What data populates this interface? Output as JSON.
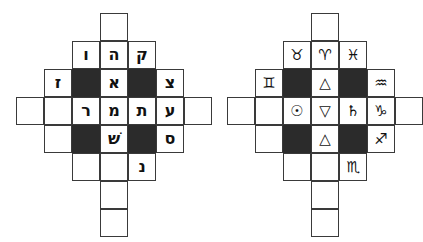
{
  "meta": {
    "background_color": "#ffffff",
    "line_color": "#3a3a3a",
    "fill_color": "#2b2b2b",
    "glyph_color": "#111111"
  },
  "figures": [
    {
      "id": "figure-left",
      "name": "hebrew-letter-cross",
      "script": "hebrew",
      "cells": [
        {
          "name": "top-outer",
          "col": 2,
          "row": 0,
          "fill": "white",
          "glyph": ""
        },
        {
          "name": "row1-col1",
          "col": 1,
          "row": 1,
          "fill": "white",
          "glyph": "ו"
        },
        {
          "name": "row1-col2",
          "col": 2,
          "row": 1,
          "fill": "white",
          "glyph": "ה"
        },
        {
          "name": "row1-col3",
          "col": 3,
          "row": 1,
          "fill": "white",
          "glyph": "ק"
        },
        {
          "name": "row2-col0",
          "col": 0,
          "row": 2,
          "fill": "white",
          "glyph": "ז"
        },
        {
          "name": "row2-col1",
          "col": 1,
          "row": 2,
          "fill": "black",
          "glyph": ""
        },
        {
          "name": "row2-col2",
          "col": 2,
          "row": 2,
          "fill": "white",
          "glyph": "א"
        },
        {
          "name": "row2-col3",
          "col": 3,
          "row": 2,
          "fill": "black",
          "glyph": ""
        },
        {
          "name": "row2-col4",
          "col": 4,
          "row": 2,
          "fill": "white",
          "glyph": "צ"
        },
        {
          "name": "row3-colm1",
          "col": -1,
          "row": 3,
          "fill": "white",
          "glyph": ""
        },
        {
          "name": "row3-col0",
          "col": 0,
          "row": 3,
          "fill": "white",
          "glyph": ""
        },
        {
          "name": "row3-col1",
          "col": 1,
          "row": 3,
          "fill": "white",
          "glyph": "ר"
        },
        {
          "name": "row3-col2",
          "col": 2,
          "row": 3,
          "fill": "white",
          "glyph": "מ"
        },
        {
          "name": "row3-col3",
          "col": 3,
          "row": 3,
          "fill": "white",
          "glyph": "ת"
        },
        {
          "name": "row3-col4",
          "col": 4,
          "row": 3,
          "fill": "white",
          "glyph": "ע"
        },
        {
          "name": "row3-col5",
          "col": 5,
          "row": 3,
          "fill": "white",
          "glyph": ""
        },
        {
          "name": "row4-col0",
          "col": 0,
          "row": 4,
          "fill": "white",
          "glyph": ""
        },
        {
          "name": "row4-col1",
          "col": 1,
          "row": 4,
          "fill": "black",
          "glyph": ""
        },
        {
          "name": "row4-col2",
          "col": 2,
          "row": 4,
          "fill": "white",
          "glyph": "שׁ"
        },
        {
          "name": "row4-col3",
          "col": 3,
          "row": 4,
          "fill": "black",
          "glyph": ""
        },
        {
          "name": "row4-col4",
          "col": 4,
          "row": 4,
          "fill": "white",
          "glyph": "ס"
        },
        {
          "name": "row5-col1",
          "col": 1,
          "row": 5,
          "fill": "white",
          "glyph": ""
        },
        {
          "name": "row5-col2",
          "col": 2,
          "row": 5,
          "fill": "white",
          "glyph": ""
        },
        {
          "name": "row5-col3",
          "col": 3,
          "row": 5,
          "fill": "white",
          "glyph": "נ"
        },
        {
          "name": "row6-col2",
          "col": 2,
          "row": 6,
          "fill": "white",
          "glyph": ""
        },
        {
          "name": "row7-col2",
          "col": 2,
          "row": 7,
          "fill": "white",
          "glyph": ""
        }
      ]
    },
    {
      "id": "figure-right",
      "name": "astrological-symbol-cross",
      "script": "astro",
      "cells": [
        {
          "name": "top-outer",
          "col": 2,
          "row": 0,
          "fill": "white",
          "glyph": "",
          "label": ""
        },
        {
          "name": "row1-col1",
          "col": 1,
          "row": 1,
          "fill": "white",
          "glyph": "♉",
          "label": "taurus"
        },
        {
          "name": "row1-col2",
          "col": 2,
          "row": 1,
          "fill": "white",
          "glyph": "♈",
          "label": "aries"
        },
        {
          "name": "row1-col3",
          "col": 3,
          "row": 1,
          "fill": "white",
          "glyph": "♓",
          "label": "pisces"
        },
        {
          "name": "row2-col0",
          "col": 0,
          "row": 2,
          "fill": "white",
          "glyph": "♊",
          "label": "gemini"
        },
        {
          "name": "row2-col1",
          "col": 1,
          "row": 2,
          "fill": "black",
          "glyph": "",
          "label": ""
        },
        {
          "name": "row2-col2",
          "col": 2,
          "row": 2,
          "fill": "white",
          "glyph": "△",
          "label": "fire-triangle"
        },
        {
          "name": "row2-col3",
          "col": 3,
          "row": 2,
          "fill": "black",
          "glyph": "",
          "label": ""
        },
        {
          "name": "row2-col4",
          "col": 4,
          "row": 2,
          "fill": "white",
          "glyph": "♒",
          "label": "aquarius"
        },
        {
          "name": "row3-colm1",
          "col": -1,
          "row": 3,
          "fill": "white",
          "glyph": "",
          "label": ""
        },
        {
          "name": "row3-col0",
          "col": 0,
          "row": 3,
          "fill": "white",
          "glyph": "",
          "label": ""
        },
        {
          "name": "row3-col1",
          "col": 1,
          "row": 3,
          "fill": "white",
          "glyph": "☉",
          "label": "sun"
        },
        {
          "name": "row3-col2",
          "col": 2,
          "row": 3,
          "fill": "white",
          "glyph": "▽",
          "label": "water-triangle"
        },
        {
          "name": "row3-col3",
          "col": 3,
          "row": 3,
          "fill": "white",
          "glyph": "♄",
          "label": "saturn"
        },
        {
          "name": "row3-col4",
          "col": 4,
          "row": 3,
          "fill": "white",
          "glyph": "♑",
          "label": "capricorn"
        },
        {
          "name": "row3-col5",
          "col": 5,
          "row": 3,
          "fill": "white",
          "glyph": "",
          "label": ""
        },
        {
          "name": "row4-col0",
          "col": 0,
          "row": 4,
          "fill": "white",
          "glyph": "",
          "label": ""
        },
        {
          "name": "row4-col1",
          "col": 1,
          "row": 4,
          "fill": "black",
          "glyph": "",
          "label": ""
        },
        {
          "name": "row4-col2",
          "col": 2,
          "row": 4,
          "fill": "white",
          "glyph": "△",
          "label": "air-triangle"
        },
        {
          "name": "row4-col3",
          "col": 3,
          "row": 4,
          "fill": "black",
          "glyph": "",
          "label": ""
        },
        {
          "name": "row4-col4",
          "col": 4,
          "row": 4,
          "fill": "white",
          "glyph": "♐",
          "label": "sagittarius"
        },
        {
          "name": "row5-col1",
          "col": 1,
          "row": 5,
          "fill": "white",
          "glyph": "",
          "label": ""
        },
        {
          "name": "row5-col2",
          "col": 2,
          "row": 5,
          "fill": "white",
          "glyph": "",
          "label": ""
        },
        {
          "name": "row5-col3",
          "col": 3,
          "row": 5,
          "fill": "white",
          "glyph": "♏",
          "label": "scorpio"
        },
        {
          "name": "row6-col2",
          "col": 2,
          "row": 6,
          "fill": "white",
          "glyph": "",
          "label": ""
        },
        {
          "name": "row7-col2",
          "col": 2,
          "row": 7,
          "fill": "white",
          "glyph": "",
          "label": ""
        }
      ]
    }
  ],
  "geometry": {
    "cell_size": 28,
    "origin_x": 44,
    "origin_y": 13
  }
}
